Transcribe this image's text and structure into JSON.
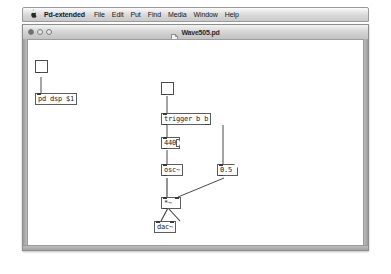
{
  "menubar": {
    "apple_icon": "apple-logo-icon",
    "app_name": "Pd-extended",
    "items": [
      {
        "label": "File"
      },
      {
        "label": "Edit"
      },
      {
        "label": "Put"
      },
      {
        "label": "Find"
      },
      {
        "label": "Media"
      },
      {
        "label": "Window"
      },
      {
        "label": "Help"
      }
    ]
  },
  "window": {
    "title": "Wave505.pd",
    "doc_icon": "document-icon",
    "controls": {
      "close_label": "close",
      "minimize_label": "minimize",
      "zoom_label": "zoom"
    }
  },
  "patch": {
    "dsp_group": {
      "toggle_name": "dsp-toggle",
      "toggle_value": "",
      "object_label": "pd dsp $1"
    },
    "chain": {
      "bang_toggle_name": "bang-toggle",
      "trigger_label": "trigger b b",
      "freq_message": "440",
      "osc_label": "osc~",
      "amp_number": "0.5",
      "multiply_label": "*~",
      "dac_label": "dac~"
    }
  },
  "colors": {
    "canvas_bg": "#ffffff",
    "object_border": "#5d5d5d",
    "cord_signal": "#3c3c3c",
    "cord_control": "#4a4a4a",
    "titlebar_text": "#2b2b2b"
  }
}
